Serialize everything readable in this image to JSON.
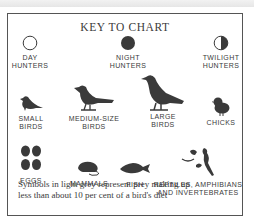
{
  "title": "KEY TO CHART",
  "hunters": [
    {
      "icon": "open-circle-icon",
      "line1": "DAY",
      "line2": "HUNTERS"
    },
    {
      "icon": "filled-circle-icon",
      "line1": "NIGHT",
      "line2": "HUNTERS"
    },
    {
      "icon": "half-circle-icon",
      "line1": "TWILIGHT",
      "line2": "HUNTERS"
    }
  ],
  "birds": [
    {
      "icon": "small-bird-icon",
      "line1": "SMALL",
      "line2": "BIRDS"
    },
    {
      "icon": "medium-bird-icon",
      "line1": "MEDIUM-SIZE",
      "line2": "BIRDS"
    },
    {
      "icon": "large-bird-icon",
      "line1": "LARGE",
      "line2": "BIRDS"
    },
    {
      "icon": "chick-icon",
      "line1": "CHICKS",
      "line2": ""
    }
  ],
  "prey": [
    {
      "icon": "eggs-icon",
      "line1": "EGGS",
      "line2": ""
    },
    {
      "icon": "mammal-icon",
      "line1": "MAMMALS",
      "line2": ""
    },
    {
      "icon": "fish-icon",
      "line1": "FISH",
      "line2": ""
    },
    {
      "icon": "reptiles-icon",
      "line1": "REPTILES, AMPHIBIANS",
      "line2": "AND INVERTEBRATES"
    }
  ],
  "note": {
    "line1": "Symbols in light grey represent prey making up",
    "line2": "less than about 10 per cent of a bird's diet"
  },
  "colors": {
    "ink": "#3a3a3a",
    "border": "#555555",
    "background": "#ffffff"
  }
}
